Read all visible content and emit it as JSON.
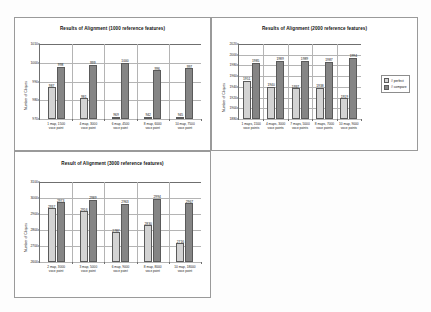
{
  "page": {
    "background": "#fdfdfd"
  },
  "colors": {
    "series1": "#d3d3d3",
    "series2": "#858585",
    "axis": "#6f6f6f",
    "grid": "#b4b4b4",
    "panel_border": "#9a9a9a"
  },
  "charts": [
    {
      "id": "chart-1000",
      "chart_data": {
        "type": "bar",
        "title": "Results of Alignment (1000 reference features)",
        "xlabel": "",
        "ylabel": "Number of Cliques",
        "categories": [
          "1 map, 1500\nvoce point",
          "4 map, 3000\nvoce point",
          "6 map, 4500\nvoce point",
          "8 map, 6000\nvoce point",
          "10 map, 7500\nvoce point"
        ],
        "series": [
          {
            "name": "# perfect",
            "values": [
              987,
              981,
              969,
              942,
              945
            ]
          },
          {
            "name": "# compare",
            "values": [
              998,
              999,
              1000,
              996,
              997
            ]
          }
        ],
        "ylim": [
          970,
          1010
        ],
        "yticks": [
          1010,
          1000,
          990,
          980,
          970
        ],
        "grid": true,
        "legend": false
      }
    },
    {
      "id": "chart-2000",
      "chart_data": {
        "type": "bar",
        "title": "Results of Alignment (2000 reference features)",
        "xlabel": "",
        "ylabel": "Number of Cliques",
        "categories": [
          "1 maps, 1500\nvoce points",
          "4 maps, 3000\nvoce points",
          "7 maps, 5000\nvoce points",
          "8 maps, 7000\nvoce points",
          "10 map, 9000\nvoce points"
        ],
        "series": [
          {
            "name": "# perfect",
            "values": [
              1951,
              1940,
              1937,
              1938,
              1919
            ]
          },
          {
            "name": "# compare",
            "values": [
              1985,
              1989,
              1989,
              1987,
              1994
            ]
          }
        ],
        "ylim": [
          1880,
          2020
        ],
        "yticks": [
          2020,
          2000,
          1980,
          1960,
          1940,
          1920,
          1900,
          1880
        ],
        "grid": true,
        "legend": true,
        "legend_position": "right",
        "legend_entries": [
          "# perfect",
          "# compare"
        ]
      }
    },
    {
      "id": "chart-3000",
      "chart_data": {
        "type": "bar",
        "title": "Result of Alignment (3000 reference features)",
        "xlabel": "",
        "ylabel": "Number of Cliques",
        "categories": [
          "2 map, 3000\nvoce point",
          "3 map, 5000\nvoce point",
          "6 map, 9000\nvoce point",
          "8 map, 8000\nvoce point",
          "10 map, 18000\nvoce point"
        ],
        "series": [
          {
            "name": "# perfect",
            "values": [
              2937,
              2916,
              2787,
              2830,
              2716
            ]
          },
          {
            "name": "# compare",
            "values": [
              2973,
              2989,
              2963,
              2994,
              2967
            ]
          }
        ],
        "ylim": [
          2600,
          3100
        ],
        "yticks": [
          3100,
          3000,
          2900,
          2800,
          2700,
          2600
        ],
        "grid": true,
        "legend": false
      }
    }
  ]
}
